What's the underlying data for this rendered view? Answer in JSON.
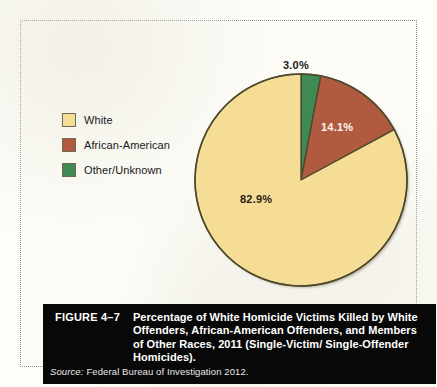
{
  "figure": {
    "number": "FIGURE 4–7",
    "title": "Percentage of White Homicide Victims Killed by White Offenders, African-American Offenders, and Members of Other Races, 2011 (Single-Victim/ Single-Offender Homicides).",
    "source_label": "Source:",
    "source_text": "Federal Bureau of Investigation 2012."
  },
  "legend": {
    "items": [
      {
        "label": "White",
        "color": "#f5dd95",
        "swatch_name": "legend-swatch-white"
      },
      {
        "label": "African-American",
        "color": "#b05b3f",
        "swatch_name": "legend-swatch-african-american"
      },
      {
        "label": "Other/Unknown",
        "color": "#3f8a52",
        "swatch_name": "legend-swatch-other-unknown"
      }
    ]
  },
  "labels": {
    "other": "3.0%",
    "african_american": "14.1%",
    "white": "82.9%"
  },
  "chart_data": {
    "type": "pie",
    "title": "Percentage of White Homicide Victims Killed by White Offenders, African-American Offenders, and Members of Other Races, 2011 (Single-Victim/ Single-Offender Homicides).",
    "categories": [
      "Other/Unknown",
      "African-American",
      "White"
    ],
    "values": [
      3.0,
      14.1,
      82.9
    ],
    "value_labels": [
      "3.0%",
      "14.1%",
      "82.9%"
    ],
    "colors": [
      "#3f8a52",
      "#b05b3f",
      "#f5dd95"
    ],
    "units": "percent",
    "start_angle_deg": 0,
    "direction": "clockwise",
    "legend_position": "left",
    "grid": false,
    "outline_color": "#4d4a2e",
    "source": "Federal Bureau of Investigation 2012."
  }
}
